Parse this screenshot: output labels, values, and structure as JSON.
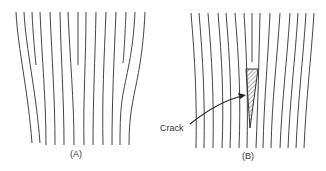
{
  "panels": [
    {
      "id": "A",
      "label": "(A)"
    },
    {
      "id": "B",
      "label": "(B)"
    }
  ],
  "annotations": {
    "crack_label": "Crack"
  },
  "colors": {
    "line": "#444444",
    "background": "#ffffff"
  }
}
